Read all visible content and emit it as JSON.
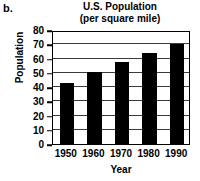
{
  "figure": {
    "label": "b."
  },
  "chart_data": {
    "type": "bar",
    "title": "U.S. Population",
    "subtitle": "(per square mile)",
    "xlabel": "Year",
    "ylabel": "Population",
    "categories": [
      "1950",
      "1960",
      "1970",
      "1980",
      "1990"
    ],
    "values": [
      42.6,
      50.6,
      57.5,
      64.0,
      70.0
    ],
    "ylim": [
      0,
      80
    ],
    "ytick_values": [
      0,
      10,
      20,
      30,
      40,
      50,
      60,
      70,
      80
    ],
    "ytick_labels": [
      "0",
      "10",
      "20",
      "30",
      "40",
      "50",
      "60",
      "70",
      "80"
    ],
    "grid": true,
    "grid_axis": "y",
    "legend": false,
    "bar_color": "#000000",
    "frame_color": "#000000"
  }
}
